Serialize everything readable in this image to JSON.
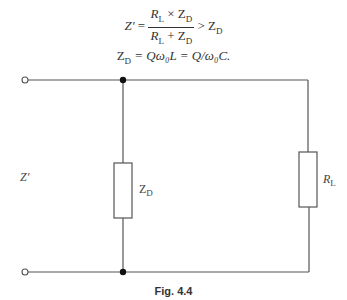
{
  "equations": {
    "eq1": {
      "lhs": "Z′",
      "equals": "=",
      "num_a": "R",
      "num_a_sub": "L",
      "num_op": "×",
      "num_b": "Z",
      "num_b_sub": "D",
      "den_a": "R",
      "den_a_sub": "L",
      "den_op": "+",
      "den_b": "Z",
      "den_b_sub": "D",
      "rel": ">",
      "rhs": "Z",
      "rhs_sub": "D"
    },
    "eq2": {
      "text_lhs": "Z",
      "lhs_sub": "D",
      "rest": " = Qω₀L = Q/ω₀C."
    }
  },
  "circuit": {
    "input_label": "Z′",
    "shunt_label": "Z",
    "shunt_label_sub": "D",
    "load_label": "R",
    "load_label_sub": "L",
    "wire_color": "#555555"
  },
  "caption": "Fig. 4.4"
}
